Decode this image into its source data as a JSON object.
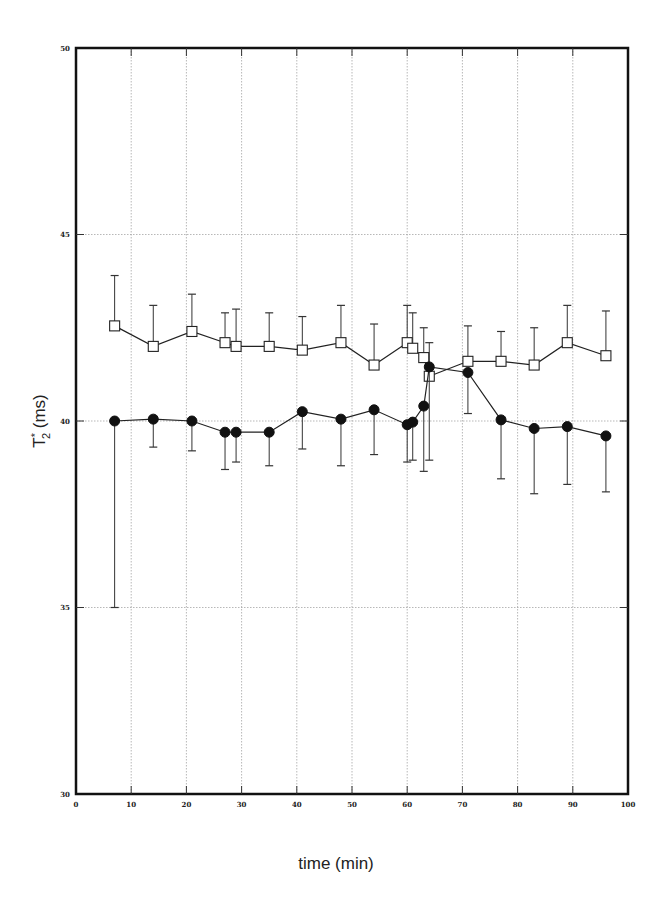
{
  "chart_data": {
    "type": "line",
    "title": "",
    "xlabel": "time (min)",
    "ylabel": "T*2 (ms)",
    "ylabel_main": "T",
    "ylabel_sup": "*",
    "ylabel_sub": "2",
    "ylabel_unit": "(ms)",
    "xlim": [
      0,
      100
    ],
    "ylim": [
      30,
      50
    ],
    "xticks": [
      0,
      10,
      20,
      30,
      40,
      50,
      60,
      70,
      80,
      90,
      100
    ],
    "yticks": [
      30,
      35,
      40,
      45,
      50
    ],
    "grid": true,
    "legend": null,
    "x": [
      7,
      14,
      21,
      27,
      29,
      35,
      41,
      48,
      54,
      60,
      61,
      63,
      64,
      71,
      77,
      83,
      89,
      96
    ],
    "series": [
      {
        "name": "open squares",
        "marker": "square-open",
        "error_direction": "up",
        "values": [
          42.55,
          42.0,
          42.4,
          42.1,
          42.0,
          42.0,
          41.9,
          42.1,
          41.5,
          42.1,
          41.95,
          41.7,
          41.2,
          41.6,
          41.6,
          41.5,
          42.1,
          41.75
        ],
        "error_bar_ends": [
          43.9,
          43.1,
          43.4,
          42.9,
          43.0,
          42.9,
          42.8,
          43.1,
          42.6,
          43.1,
          42.9,
          42.5,
          42.1,
          42.55,
          42.4,
          42.5,
          43.1,
          42.95
        ]
      },
      {
        "name": "filled circles",
        "marker": "circle-filled",
        "error_direction": "down",
        "values": [
          40.0,
          40.05,
          40.0,
          39.7,
          39.7,
          39.7,
          40.25,
          40.05,
          40.3,
          39.9,
          39.97,
          40.4,
          41.45,
          41.3,
          40.03,
          39.8,
          39.85,
          39.6
        ],
        "error_bar_ends": [
          35.0,
          39.3,
          39.2,
          38.7,
          38.9,
          38.8,
          39.25,
          38.8,
          39.1,
          38.9,
          38.95,
          38.65,
          38.95,
          40.2,
          38.45,
          38.05,
          38.3,
          38.1
        ]
      }
    ]
  }
}
